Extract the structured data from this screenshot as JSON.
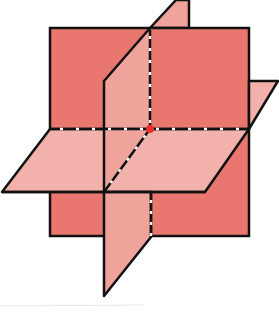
{
  "diagram": {
    "colors": {
      "vertical_front_plane": "#e9776f",
      "horizontal_plane": "#f2b2ab",
      "vertical_side_plane": "#efa39b",
      "outline": "#111111",
      "hidden_edge_dash": "#ffffff",
      "intersection_point": "#e8322a",
      "baseline": "#f1e4dc"
    },
    "intersection_point": {
      "x": 150,
      "y": 129
    }
  }
}
